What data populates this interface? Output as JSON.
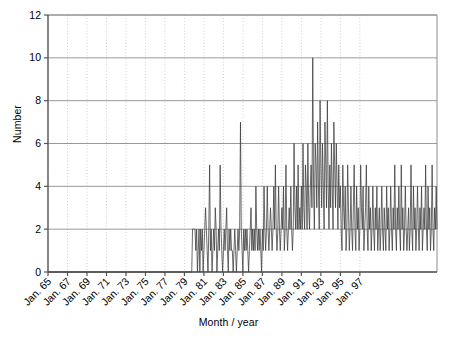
{
  "chart_data": {
    "type": "line",
    "title": "",
    "xlabel": "Month / year",
    "ylabel": "Number",
    "ylim": [
      0,
      12
    ],
    "yticks": [
      0,
      2,
      4,
      6,
      8,
      10,
      12
    ],
    "grid": "vertical dotted every 2 years, horizontal solid at each y tick",
    "legend": null,
    "x_start_label": "Jan. 65",
    "x_end_label": "Jan. 97",
    "xtick_labels": [
      "Jan. 65",
      "Jan. 67",
      "Jan. 69",
      "Jan. 71",
      "Jan. 73",
      "Jan. 75",
      "Jan. 77",
      "Jan. 79",
      "Jan. 81",
      "Jan. 83",
      "Jan. 85",
      "Jan. 87",
      "Jan. 89",
      "Jan. 91",
      "Jan. 93",
      "Jan. 95",
      "Jan. 97"
    ],
    "x_unit": "month",
    "x_first_month": "1965-01",
    "x_last_month": "1997-12",
    "series_name": "Number",
    "line_color": "#3a3a3a",
    "values": [
      0,
      0,
      0,
      0,
      0,
      0,
      0,
      0,
      0,
      0,
      0,
      0,
      0,
      0,
      0,
      0,
      0,
      0,
      0,
      0,
      0,
      0,
      0,
      0,
      0,
      0,
      0,
      0,
      0,
      0,
      0,
      0,
      0,
      0,
      0,
      0,
      0,
      0,
      0,
      0,
      0,
      0,
      0,
      0,
      0,
      0,
      0,
      0,
      0,
      0,
      0,
      0,
      0,
      0,
      0,
      0,
      0,
      0,
      0,
      0,
      0,
      0,
      0,
      0,
      0,
      0,
      0,
      0,
      0,
      0,
      0,
      0,
      0,
      0,
      0,
      0,
      0,
      0,
      0,
      0,
      0,
      0,
      0,
      0,
      0,
      0,
      0,
      0,
      0,
      0,
      0,
      0,
      0,
      0,
      0,
      0,
      0,
      0,
      0,
      0,
      0,
      0,
      0,
      0,
      0,
      0,
      0,
      0,
      0,
      0,
      0,
      0,
      0,
      0,
      0,
      0,
      0,
      0,
      0,
      0,
      0,
      0,
      0,
      0,
      0,
      0,
      0,
      0,
      0,
      0,
      0,
      0,
      0,
      0,
      0,
      0,
      0,
      0,
      0,
      0,
      0,
      0,
      0,
      0,
      0,
      0,
      0,
      0,
      0,
      0,
      0,
      0,
      0,
      0,
      0,
      0,
      0,
      0,
      0,
      0,
      0,
      0,
      0,
      0,
      0,
      0,
      0,
      0,
      0,
      0,
      0,
      0,
      0,
      0,
      0,
      0,
      0,
      0,
      2,
      2,
      2,
      2,
      1,
      2,
      0,
      1,
      2,
      0,
      2,
      1,
      2,
      0,
      1,
      2,
      3,
      2,
      1,
      0,
      2,
      5,
      1,
      2,
      0,
      1,
      2,
      1,
      3,
      2,
      0,
      1,
      2,
      1,
      5,
      2,
      1,
      0,
      1,
      2,
      1,
      2,
      3,
      1,
      0,
      2,
      1,
      2,
      1,
      1,
      0,
      1,
      2,
      1,
      0,
      1,
      2,
      1,
      2,
      7,
      2,
      1,
      0,
      2,
      1,
      2,
      1,
      2,
      1,
      0,
      1,
      2,
      3,
      1,
      2,
      1,
      2,
      1,
      4,
      2,
      1,
      2,
      1,
      2,
      1,
      0,
      2,
      1,
      4,
      2,
      1,
      2,
      4,
      2,
      1,
      2,
      3,
      2,
      1,
      2,
      4,
      2,
      5,
      2,
      1,
      2,
      4,
      2,
      1,
      2,
      3,
      2,
      4,
      1,
      2,
      5,
      2,
      1,
      2,
      3,
      2,
      4,
      2,
      1,
      2,
      6,
      3,
      2,
      4,
      2,
      5,
      2,
      3,
      2,
      4,
      2,
      6,
      3,
      2,
      5,
      4,
      2,
      6,
      3,
      2,
      4,
      5,
      3,
      10,
      4,
      2,
      6,
      5,
      3,
      7,
      4,
      2,
      8,
      5,
      3,
      6,
      4,
      2,
      7,
      5,
      3,
      8,
      4,
      2,
      5,
      3,
      6,
      4,
      2,
      7,
      5,
      3,
      6,
      4,
      2,
      5,
      3,
      4,
      2,
      1,
      5,
      3,
      2,
      4,
      1,
      2,
      5,
      3,
      1,
      2,
      4,
      2,
      1,
      3,
      5,
      2,
      1,
      4,
      2,
      3,
      1,
      2,
      5,
      3,
      2,
      4,
      1,
      2,
      3,
      5,
      2,
      1,
      4,
      2,
      3,
      1,
      2,
      4,
      2,
      1,
      3,
      2,
      4,
      1,
      2,
      3,
      1,
      2,
      4,
      2,
      1,
      3,
      2,
      1,
      4,
      2,
      3,
      1,
      2,
      4,
      2,
      1,
      3,
      2,
      5,
      2,
      1,
      3,
      2,
      4,
      2,
      1,
      5,
      2,
      3,
      1,
      2,
      4,
      2,
      1,
      2,
      3,
      1,
      2,
      5,
      2,
      1,
      4,
      2,
      3,
      1,
      2,
      4,
      2,
      1,
      3,
      2,
      4,
      1,
      2,
      3,
      2,
      5,
      2,
      1,
      4,
      2,
      3,
      1,
      2,
      5,
      2,
      1,
      3,
      2,
      4,
      2
    ]
  },
  "axis": {
    "y_tick_0": "0",
    "y_tick_2": "2",
    "y_tick_4": "4",
    "y_tick_6": "6",
    "y_tick_8": "8",
    "y_tick_10": "10",
    "y_tick_12": "12"
  },
  "caption": {
    "text": ""
  }
}
